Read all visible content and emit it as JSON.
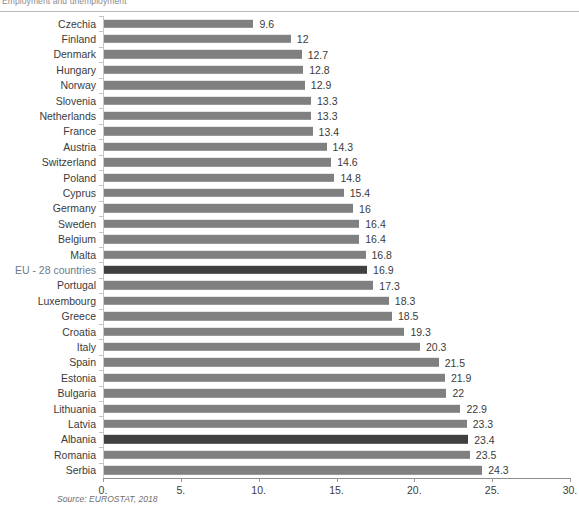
{
  "header": {
    "caption": "Employment and unemployment"
  },
  "source_note": "Source: EUROSTAT, 2018",
  "colors": {
    "bar": "#808080",
    "bar_highlight": "#404040",
    "highlight_label": "#6b7b8c",
    "axis": "#8d8d8d",
    "text": "#3b3b3b"
  },
  "chart_data": {
    "type": "bar",
    "orientation": "horizontal",
    "title": "",
    "subtitle": "",
    "xlabel": "",
    "ylabel": "",
    "xlim": [
      0,
      30
    ],
    "grid": false,
    "legend": "none",
    "xticks": [
      "0.",
      "5.",
      "10.",
      "15.",
      "20.",
      "25.",
      "30."
    ],
    "xtick_values": [
      0,
      5,
      10,
      15,
      20,
      25,
      30
    ],
    "categories": [
      "Czechia",
      "Finland",
      "Denmark",
      "Hungary",
      "Norway",
      "Slovenia",
      "Netherlands",
      "France",
      "Austria",
      "Switzerland",
      "Poland",
      "Cyprus",
      "Germany",
      "Sweden",
      "Belgium",
      "Malta",
      "EU - 28 countries",
      "Portugal",
      "Luxembourg",
      "Greece",
      "Croatia",
      "Italy",
      "Spain",
      "Estonia",
      "Bulgaria",
      "Lithuania",
      "Latvia",
      "Albania",
      "Romania",
      "Serbia"
    ],
    "values": [
      9.6,
      12,
      12.7,
      12.8,
      12.9,
      13.3,
      13.3,
      13.4,
      14.3,
      14.6,
      14.8,
      15.4,
      16,
      16.4,
      16.4,
      16.8,
      16.9,
      17.3,
      18.3,
      18.5,
      19.3,
      20.3,
      21.5,
      21.9,
      22,
      22.9,
      23.3,
      23.4,
      23.5,
      24.3
    ],
    "value_labels": [
      "9.6",
      "12",
      "12.7",
      "12.8",
      "12.9",
      "13.3",
      "13.3",
      "13.4",
      "14.3",
      "14.6",
      "14.8",
      "15.4",
      "16",
      "16.4",
      "16.4",
      "16.8",
      "16.9",
      "17.3",
      "18.3",
      "18.5",
      "19.3",
      "20.3",
      "21.5",
      "21.9",
      "22",
      "22.9",
      "23.3",
      "23.4",
      "23.5",
      "24.3"
    ],
    "highlighted": [
      "EU - 28 countries",
      "Albania"
    ]
  }
}
